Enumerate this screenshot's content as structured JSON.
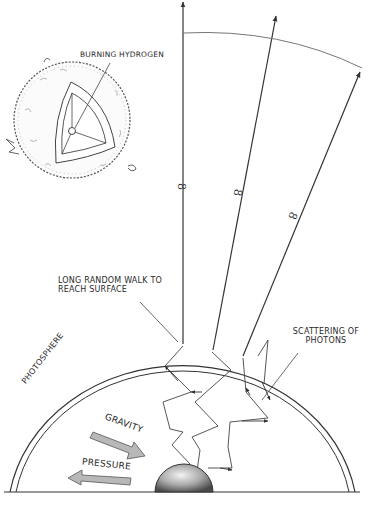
{
  "diagram": {
    "labels": {
      "burning_hydrogen": "Burning Hydrogen",
      "random_walk": "Long random walk to reach surface",
      "scattering": "Scattering of photons",
      "photosphere": "Photosphere",
      "gravity": "Gravity",
      "pressure": "Pressure"
    },
    "infinity_marks": [
      "8",
      "8",
      "8"
    ],
    "colors": {
      "ink": "#2a2a2a",
      "arrow_fill": "#b8b8b8",
      "core_fill": "#9a9a9a",
      "background": "#ffffff"
    }
  }
}
